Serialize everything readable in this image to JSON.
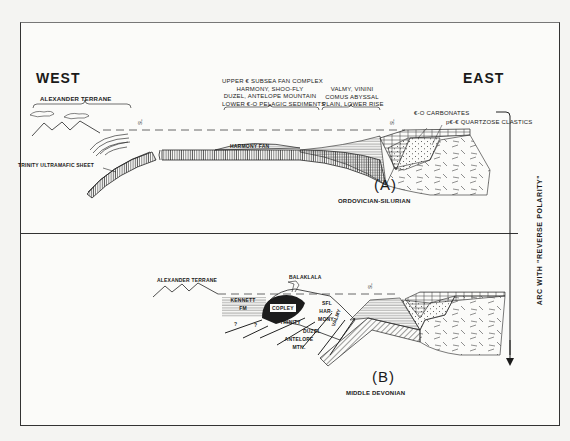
{
  "diagram": {
    "type": "geologic-cross-section",
    "panel_a": {
      "label": "(A)",
      "age": "ORDOVICIAN-SILURIAN",
      "west": "WEST",
      "east": "EAST",
      "units": {
        "alexander_terrane": "ALEXANDER TERRANE",
        "trinity_sheet": "TRINITY ULTRAMAFIC SHEET",
        "harmony_fan": "HARMONY FAN",
        "subsea_fan_lines": [
          "UPPER € SUBSEA FAN COMPLEX",
          "HARMONY, SHOO-FLY",
          "DUZEL, ANTELOPE MOUNTAIN",
          "LOWER €-O PELAGIC SEDIMENTS"
        ],
        "abyssal_lines": [
          "VALMY, VININI",
          "COMUS ABYSSAL",
          "PLAIN, LOWER RISE"
        ],
        "carbonates": "€-O CARBONATES",
        "quartzose": "p€-€ QUARTZOSE CLASTICS",
        "sea_level_marker": "SL"
      }
    },
    "panel_b": {
      "label": "(B)",
      "age": "MIDDLE DEVONIAN",
      "units": {
        "alexander_terrane": "ALEXANDER TERRANE",
        "kennett": [
          "KENNETT",
          "FM"
        ],
        "balaklala": "BALAKLALA",
        "copley": "COPLEY",
        "trinity": "TRINITY",
        "duzel": "DUZEL",
        "antelope": [
          "ANTELOPE",
          "MTN."
        ],
        "harmony": [
          "HAR-",
          "MONY"
        ],
        "shoo_fly": "SFL",
        "valmy": "VALMY",
        "query_marks": [
          "?",
          "?"
        ],
        "sea_level_marker": "SL"
      }
    },
    "side_arrow": {
      "label": "ARC WITH \"REVERSE POLARITY\""
    },
    "colors": {
      "ink": "#1a1a1a",
      "paper": "#fbfbf9",
      "copley_fill": "#1c1c1c"
    }
  }
}
